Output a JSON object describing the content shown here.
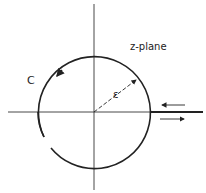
{
  "diagram": {
    "type": "complex-plane contour",
    "labels": {
      "plane": "z-plane",
      "contour": "C",
      "radius": "ε"
    },
    "geometry": {
      "center": [
        94,
        112
      ],
      "radius": 56,
      "branch_cut": "positive real axis, drawn bold from circle to right edge",
      "contour_direction": "counterclockwise (arrow on upper-left arc)",
      "upper_path_arrow": "leftward",
      "lower_path_arrow": "rightward",
      "gap_in_circle": "lower-left arc"
    },
    "colors": {
      "ink": "#222222",
      "background": "#ffffff"
    }
  }
}
